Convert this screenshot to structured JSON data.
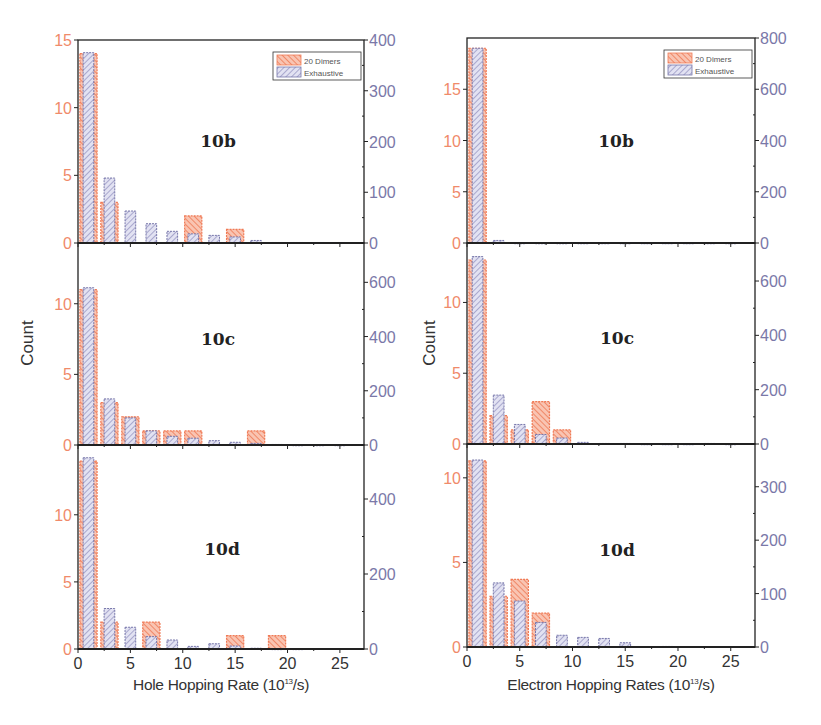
{
  "colors": {
    "orange": "#f07a55",
    "orange_fill": "#f6b09a",
    "purple": "#7777aa",
    "purple_fill": "#cfcfea",
    "left_tick": "#f08a6a",
    "right_tick": "#7a78a8",
    "axis": "#222222"
  },
  "legend": {
    "series_a": "20 Dimers",
    "series_b": "Exhaustive"
  },
  "columns": [
    {
      "id": "hole",
      "xlabel_main": "Hole Hopping Rate (10",
      "xlabel_sup": "13",
      "xlabel_end": "/s)",
      "ylabel": "Count"
    },
    {
      "id": "electron",
      "xlabel_main": "Electron Hopping Rates (10",
      "xlabel_sup": "13",
      "xlabel_end": "/s)",
      "ylabel": "Count"
    }
  ],
  "x_ticks": [
    "0",
    "5",
    "10",
    "15",
    "20",
    "25"
  ],
  "chart_data": [
    {
      "type": "bar",
      "title": "10b",
      "column": "Hole Hopping Rate (10^13/s)",
      "xlabel": "Hole Hopping Rate (10^13/s)",
      "ylabel": "Count",
      "xlim": [
        0,
        27.3
      ],
      "ylim_left": [
        0,
        15
      ],
      "ylim_right": [
        0,
        400
      ],
      "left_ticks": [
        0,
        5,
        10,
        15
      ],
      "right_ticks": [
        0,
        100,
        200,
        300,
        400
      ],
      "bin_centers": [
        1,
        3,
        5,
        7,
        9,
        11,
        13,
        15,
        17,
        19,
        21,
        23,
        25
      ],
      "series": [
        {
          "name": "20 Dimers",
          "axis": "left",
          "values": [
            14,
            3,
            0,
            0,
            0,
            2,
            0,
            1,
            0,
            0,
            0,
            0,
            0
          ]
        },
        {
          "name": "Exhaustive",
          "axis": "right",
          "values": [
            375,
            128,
            63,
            38,
            23,
            18,
            15,
            12,
            5,
            1,
            1,
            1,
            1
          ]
        }
      ],
      "legend": true
    },
    {
      "type": "bar",
      "title": "10c",
      "column": "Hole Hopping Rate (10^13/s)",
      "xlabel": "Hole Hopping Rate (10^13/s)",
      "ylabel": "Count",
      "xlim": [
        0,
        27.3
      ],
      "ylim_left": [
        0,
        14.3
      ],
      "ylim_right": [
        0,
        745
      ],
      "left_ticks": [
        0,
        5,
        10
      ],
      "right_ticks": [
        0,
        200,
        400,
        600
      ],
      "bin_centers": [
        1,
        3,
        5,
        7,
        9,
        11,
        13,
        15,
        17,
        19,
        21,
        23,
        25
      ],
      "series": [
        {
          "name": "20 Dimers",
          "axis": "left",
          "values": [
            11,
            3,
            2,
            1,
            1,
            1,
            0,
            0,
            1,
            0,
            0,
            0,
            0
          ]
        },
        {
          "name": "Exhaustive",
          "axis": "right",
          "values": [
            580,
            170,
            100,
            52,
            32,
            25,
            16,
            10,
            6,
            2,
            1,
            1,
            1
          ]
        }
      ]
    },
    {
      "type": "bar",
      "title": "10d",
      "column": "Hole Hopping Rate (10^13/s)",
      "xlabel": "Hole Hopping Rate (10^13/s)",
      "ylabel": "Count",
      "xlim": [
        0,
        27.3
      ],
      "ylim_left": [
        0,
        15.2
      ],
      "ylim_right": [
        0,
        544
      ],
      "left_ticks": [
        0,
        5,
        10
      ],
      "right_ticks": [
        0,
        200,
        400
      ],
      "bin_centers": [
        1,
        3,
        5,
        7,
        9,
        11,
        13,
        15,
        17,
        19,
        21,
        23,
        25
      ],
      "series": [
        {
          "name": "20 Dimers",
          "axis": "left",
          "values": [
            14,
            2,
            0,
            2,
            0,
            0,
            0,
            1,
            0,
            1,
            0,
            0,
            0
          ]
        },
        {
          "name": "Exhaustive",
          "axis": "right",
          "values": [
            510,
            108,
            58,
            33,
            24,
            7,
            14,
            8,
            2,
            1,
            1,
            0,
            0
          ]
        }
      ]
    },
    {
      "type": "bar",
      "title": "10b",
      "column": "Electron Hopping Rates (10^13/s)",
      "xlabel": "Electron Hopping Rates (10^13/s)",
      "ylabel": "Count",
      "xlim": [
        0,
        27.3
      ],
      "ylim_left": [
        0,
        20
      ],
      "ylim_right": [
        0,
        800
      ],
      "left_ticks": [
        0,
        5,
        10,
        15
      ],
      "right_ticks": [
        0,
        200,
        400,
        600,
        800
      ],
      "bin_centers": [
        1,
        3,
        5,
        7,
        9,
        11,
        13,
        15,
        17,
        19,
        21,
        23,
        25
      ],
      "series": [
        {
          "name": "20 Dimers",
          "axis": "left",
          "values": [
            19,
            0,
            0,
            0,
            0,
            0,
            0,
            0,
            0,
            0,
            0,
            0,
            0
          ]
        },
        {
          "name": "Exhaustive",
          "axis": "right",
          "values": [
            760,
            10,
            1,
            1,
            1,
            1,
            1,
            1,
            1,
            1,
            1,
            1,
            1
          ]
        }
      ],
      "legend": true
    },
    {
      "type": "bar",
      "title": "10c",
      "column": "Electron Hopping Rates (10^13/s)",
      "xlabel": "Electron Hopping Rates (10^13/s)",
      "ylabel": "Count",
      "xlim": [
        0,
        27.3
      ],
      "ylim_left": [
        0,
        14.2
      ],
      "ylim_right": [
        0,
        740
      ],
      "left_ticks": [
        0,
        5,
        10
      ],
      "right_ticks": [
        0,
        200,
        400,
        600
      ],
      "bin_centers": [
        1,
        3,
        5,
        7,
        9,
        11,
        13,
        15,
        17,
        19,
        21,
        23,
        25
      ],
      "series": [
        {
          "name": "20 Dimers",
          "axis": "left",
          "values": [
            13,
            2,
            1,
            3,
            1,
            0,
            0,
            0,
            0,
            0,
            0,
            0,
            0
          ]
        },
        {
          "name": "Exhaustive",
          "axis": "right",
          "values": [
            690,
            180,
            72,
            35,
            22,
            6,
            2,
            2,
            1,
            1,
            1,
            2,
            1
          ]
        }
      ]
    },
    {
      "type": "bar",
      "title": "10d",
      "column": "Electron Hopping Rates (10^13/s)",
      "xlabel": "Electron Hopping Rates (10^13/s)",
      "ylabel": "Count",
      "xlim": [
        0,
        27.3
      ],
      "ylim_left": [
        0,
        12
      ],
      "ylim_right": [
        0,
        380
      ],
      "left_ticks": [
        0,
        5,
        10
      ],
      "right_ticks": [
        0,
        100,
        200,
        300
      ],
      "bin_centers": [
        1,
        3,
        5,
        7,
        9,
        11,
        13,
        15,
        17,
        19,
        21,
        23,
        25
      ],
      "series": [
        {
          "name": "20 Dimers",
          "axis": "left",
          "values": [
            11,
            3,
            4,
            2,
            0,
            0,
            0,
            0,
            0,
            0,
            0,
            0,
            0
          ]
        },
        {
          "name": "Exhaustive",
          "axis": "right",
          "values": [
            350,
            120,
            86,
            46,
            22,
            18,
            16,
            8,
            0,
            1,
            0,
            0,
            0
          ]
        }
      ]
    }
  ]
}
